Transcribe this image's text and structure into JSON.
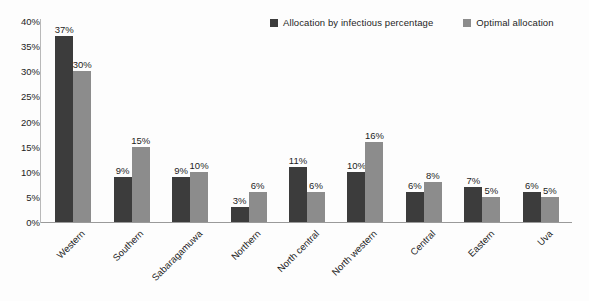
{
  "chart_data": {
    "type": "bar",
    "title": "",
    "subtitle": "",
    "xlabel": "",
    "ylabel": "",
    "ylim": [
      0,
      40
    ],
    "ytick_values": [
      0,
      5,
      10,
      15,
      20,
      25,
      30,
      35,
      40
    ],
    "ytick_labels": [
      "0%",
      "5%",
      "10%",
      "15%",
      "20%",
      "25%",
      "30%",
      "35%",
      "40%"
    ],
    "grid": false,
    "legend_position": "top-right",
    "value_suffix": "%",
    "categories": [
      "Western",
      "Southern",
      "Sabaragamuwa",
      "Northern",
      "North central",
      "North western",
      "Central",
      "Eastern",
      "Uva"
    ],
    "series": [
      {
        "name": "Allocation by infectious percentage",
        "color": "#3c3c3c",
        "values": [
          37,
          9,
          9,
          3,
          11,
          10,
          6,
          7,
          6
        ],
        "labels": [
          "37%",
          "9%",
          "9%",
          "3%",
          "11%",
          "10%",
          "6%",
          "7%",
          "6%"
        ]
      },
      {
        "name": "Optimal allocation",
        "color": "#8c8c8c",
        "values": [
          30,
          15,
          10,
          6,
          6,
          16,
          8,
          5,
          5
        ],
        "labels": [
          "30%",
          "15%",
          "10%",
          "6%",
          "6%",
          "16%",
          "8%",
          "5%",
          "5%"
        ]
      }
    ]
  },
  "colors": {
    "series_dark": "#3c3c3c",
    "series_light": "#8c8c8c",
    "axis": "#9a9a9a",
    "text": "#1d1d1d",
    "background": "#fdfdfd"
  }
}
